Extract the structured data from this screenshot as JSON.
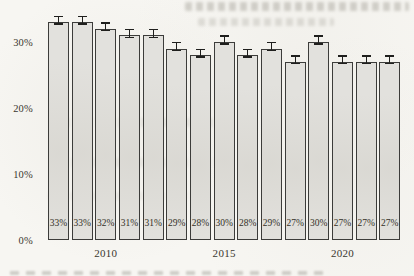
{
  "chart_data": {
    "type": "bar",
    "title": "",
    "categories": [
      "2008",
      "2009",
      "2010",
      "2011",
      "2012",
      "2013",
      "2014",
      "2015",
      "2016",
      "2017",
      "2018",
      "2019",
      "2020",
      "2021",
      "2022"
    ],
    "values": [
      33,
      33,
      32,
      31,
      31,
      29,
      28,
      30,
      28,
      29,
      27,
      30,
      27,
      27,
      27
    ],
    "bar_labels": [
      "33%",
      "33%",
      "32%",
      "31%",
      "31%",
      "29%",
      "28%",
      "30%",
      "28%",
      "29%",
      "27%",
      "30%",
      "27%",
      "27%",
      "27%"
    ],
    "error": 0.7,
    "y_ticks": [
      {
        "label": "0%",
        "value": 0
      },
      {
        "label": "10%",
        "value": 10
      },
      {
        "label": "20%",
        "value": 20
      },
      {
        "label": "30%",
        "value": 30
      }
    ],
    "x_ticks": [
      {
        "label": "2010",
        "bar_index": 2
      },
      {
        "label": "2015",
        "bar_index": 7
      },
      {
        "label": "2020",
        "bar_index": 12
      }
    ],
    "ylim": [
      0,
      35
    ],
    "grid": false,
    "legend": "none",
    "colors": {
      "bar_fill": "#e2e1dd",
      "bar_border": "#3c3c3a",
      "error_bar": "#1f1f1d",
      "text": "#3a372f",
      "page_background": "#f7f6f2"
    }
  }
}
